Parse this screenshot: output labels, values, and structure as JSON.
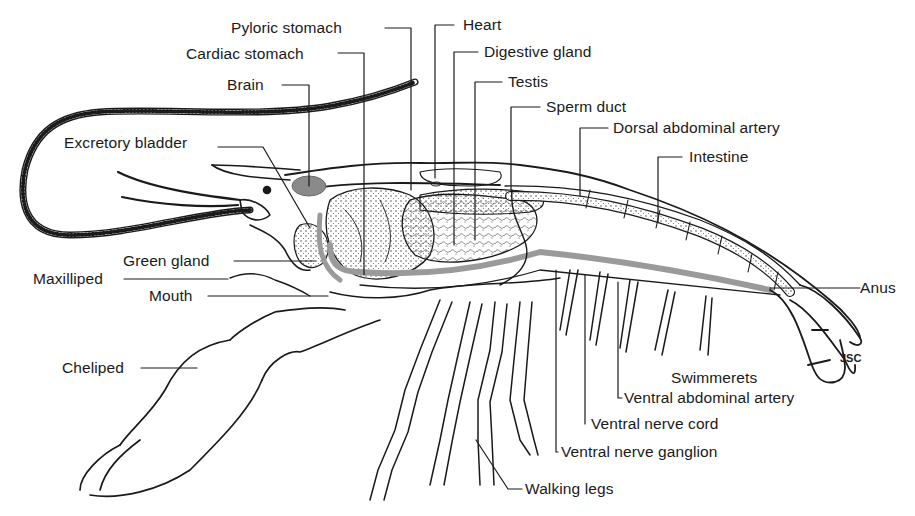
{
  "figure": {
    "artist_initials": "JSC",
    "colors": {
      "ink": "#1a1a1a",
      "shading": "#9a9a9a",
      "background": "#ffffff"
    }
  },
  "labels": {
    "pyloric_stomach": "Pyloric stomach",
    "cardiac_stomach": "Cardiac stomach",
    "brain": "Brain",
    "excretory_bladder": "Excretory bladder",
    "green_gland": "Green gland",
    "maxilliped": "Maxilliped",
    "mouth": "Mouth",
    "cheliped": "Cheliped",
    "heart": "Heart",
    "digestive_gland": "Digestive gland",
    "testis": "Testis",
    "sperm_duct": "Sperm duct",
    "dorsal_abdominal_artery": "Dorsal abdominal artery",
    "intestine": "Intestine",
    "anus": "Anus",
    "swimmerets": "Swimmerets",
    "ventral_abdominal_artery": "Ventral abdominal  artery",
    "ventral_nerve_cord": "Ventral nerve cord",
    "ventral_nerve_ganglion": "Ventral nerve ganglion",
    "walking_legs": "Walking legs"
  }
}
